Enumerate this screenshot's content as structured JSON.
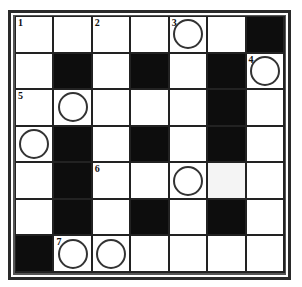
{
  "puzzle": {
    "rows": 7,
    "cols": 7,
    "colors": {
      "black": "#0d0d0d",
      "white": "#ffffff",
      "grid_line": "#222222"
    },
    "cells": [
      [
        {
          "t": "w",
          "n": "1"
        },
        {
          "t": "w"
        },
        {
          "t": "w",
          "n": "2"
        },
        {
          "t": "w"
        },
        {
          "t": "w",
          "n": "3",
          "c": true
        },
        {
          "t": "w"
        },
        {
          "t": "b"
        }
      ],
      [
        {
          "t": "w"
        },
        {
          "t": "b"
        },
        {
          "t": "w"
        },
        {
          "t": "b"
        },
        {
          "t": "w"
        },
        {
          "t": "b"
        },
        {
          "t": "w",
          "n": "4",
          "c": true
        }
      ],
      [
        {
          "t": "w",
          "n": "5"
        },
        {
          "t": "w",
          "c": true
        },
        {
          "t": "w"
        },
        {
          "t": "w"
        },
        {
          "t": "w"
        },
        {
          "t": "b"
        },
        {
          "t": "w"
        }
      ],
      [
        {
          "t": "w",
          "c": true
        },
        {
          "t": "b"
        },
        {
          "t": "w"
        },
        {
          "t": "b"
        },
        {
          "t": "w"
        },
        {
          "t": "b"
        },
        {
          "t": "w"
        }
      ],
      [
        {
          "t": "w"
        },
        {
          "t": "b"
        },
        {
          "t": "w",
          "n": "6"
        },
        {
          "t": "w"
        },
        {
          "t": "w",
          "c": true
        },
        {
          "t": "l"
        },
        {
          "t": "w"
        }
      ],
      [
        {
          "t": "w"
        },
        {
          "t": "b"
        },
        {
          "t": "w"
        },
        {
          "t": "b"
        },
        {
          "t": "w"
        },
        {
          "t": "b"
        },
        {
          "t": "w"
        }
      ],
      [
        {
          "t": "b"
        },
        {
          "t": "w",
          "n": "7",
          "c": true
        },
        {
          "t": "w",
          "c": true
        },
        {
          "t": "w"
        },
        {
          "t": "w"
        },
        {
          "t": "w"
        },
        {
          "t": "w"
        }
      ]
    ]
  }
}
